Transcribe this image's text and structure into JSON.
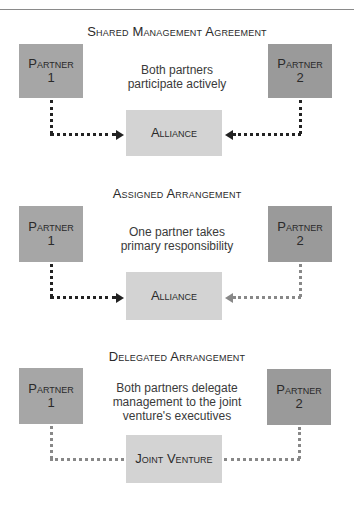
{
  "sections": [
    {
      "title": "Shared Management Agreement",
      "partner1": {
        "label": "Partner",
        "number": "1"
      },
      "partner2": {
        "label": "Partner",
        "number": "2"
      },
      "description": [
        "Both partners",
        "participate actively"
      ],
      "center": "Alliance",
      "connectors": {
        "left": "dark-arrow",
        "right": "dark-arrow"
      }
    },
    {
      "title": "Assigned Arrangement",
      "partner1": {
        "label": "Partner",
        "number": "1"
      },
      "partner2": {
        "label": "Partner",
        "number": "2"
      },
      "description": [
        "One partner takes",
        "primary responsibility"
      ],
      "center": "Alliance",
      "connectors": {
        "left": "dark-arrow",
        "right": "light-arrow"
      }
    },
    {
      "title": "Delegated Arrangement",
      "partner1": {
        "label": "Partner",
        "number": "1"
      },
      "partner2": {
        "label": "Partner",
        "number": "2"
      },
      "description": [
        "Both partners delegate",
        "management to the joint",
        "venture's executives"
      ],
      "center": "Joint Venture",
      "connectors": {
        "left": "light-line",
        "right": "light-line"
      }
    }
  ],
  "colors": {
    "partner1": "#a6a6a6",
    "partner2": "#9a9a9a",
    "center": "#d3d3d3",
    "dark_line": "#222222",
    "light_line": "#888888"
  }
}
